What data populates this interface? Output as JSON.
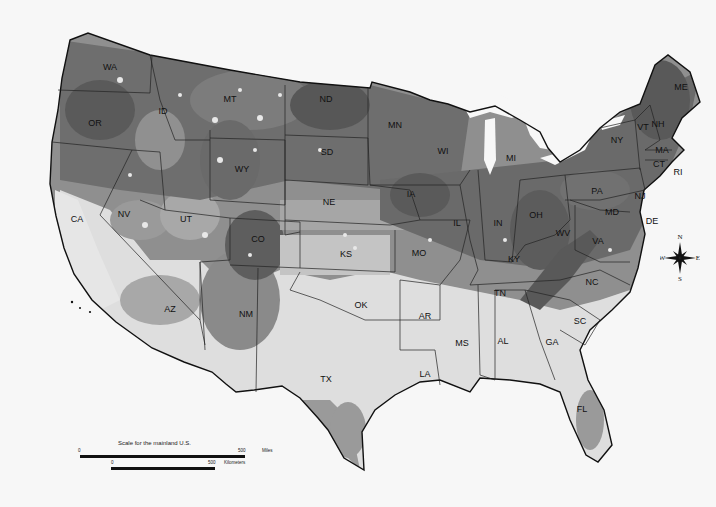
{
  "map": {
    "subject": "Contiguous United States shaded grayscale map",
    "palette": {
      "darkest": "#4a4a4a",
      "dark": "#6b6b6b",
      "medium": "#8f8f8f",
      "light": "#bdbdbd",
      "lightest": "#dedede",
      "water": "#f7f7f7",
      "border": "#111111"
    },
    "state_labels": [
      {
        "abbr": "WA",
        "x": 110,
        "y": 68
      },
      {
        "abbr": "OR",
        "x": 95,
        "y": 124
      },
      {
        "abbr": "CA",
        "x": 77,
        "y": 220
      },
      {
        "abbr": "NV",
        "x": 124,
        "y": 215
      },
      {
        "abbr": "ID",
        "x": 163,
        "y": 112
      },
      {
        "abbr": "MT",
        "x": 230,
        "y": 100
      },
      {
        "abbr": "WY",
        "x": 242,
        "y": 170
      },
      {
        "abbr": "UT",
        "x": 186,
        "y": 220
      },
      {
        "abbr": "CO",
        "x": 258,
        "y": 240
      },
      {
        "abbr": "AZ",
        "x": 170,
        "y": 310
      },
      {
        "abbr": "NM",
        "x": 246,
        "y": 315
      },
      {
        "abbr": "ND",
        "x": 326,
        "y": 100
      },
      {
        "abbr": "SD",
        "x": 327,
        "y": 153
      },
      {
        "abbr": "NE",
        "x": 329,
        "y": 203
      },
      {
        "abbr": "KS",
        "x": 346,
        "y": 255
      },
      {
        "abbr": "OK",
        "x": 361,
        "y": 306
      },
      {
        "abbr": "TX",
        "x": 326,
        "y": 380
      },
      {
        "abbr": "MN",
        "x": 395,
        "y": 126
      },
      {
        "abbr": "IA",
        "x": 411,
        "y": 195
      },
      {
        "abbr": "MO",
        "x": 419,
        "y": 254
      },
      {
        "abbr": "AR",
        "x": 425,
        "y": 317
      },
      {
        "abbr": "LA",
        "x": 425,
        "y": 375
      },
      {
        "abbr": "WI",
        "x": 443,
        "y": 152
      },
      {
        "abbr": "IL",
        "x": 457,
        "y": 224
      },
      {
        "abbr": "MS",
        "x": 462,
        "y": 344
      },
      {
        "abbr": "MI",
        "x": 511,
        "y": 159
      },
      {
        "abbr": "IN",
        "x": 498,
        "y": 224
      },
      {
        "abbr": "KY",
        "x": 514,
        "y": 260
      },
      {
        "abbr": "TN",
        "x": 500,
        "y": 294
      },
      {
        "abbr": "AL",
        "x": 503,
        "y": 342
      },
      {
        "abbr": "GA",
        "x": 552,
        "y": 343
      },
      {
        "abbr": "FL",
        "x": 582,
        "y": 410
      },
      {
        "abbr": "OH",
        "x": 536,
        "y": 216
      },
      {
        "abbr": "WV",
        "x": 563,
        "y": 234
      },
      {
        "abbr": "VA",
        "x": 598,
        "y": 242
      },
      {
        "abbr": "NC",
        "x": 592,
        "y": 283
      },
      {
        "abbr": "SC",
        "x": 580,
        "y": 322
      },
      {
        "abbr": "PA",
        "x": 597,
        "y": 192
      },
      {
        "abbr": "NY",
        "x": 617,
        "y": 141
      },
      {
        "abbr": "NJ",
        "x": 640,
        "y": 197
      },
      {
        "abbr": "MD",
        "x": 612,
        "y": 213
      },
      {
        "abbr": "DE",
        "x": 652,
        "y": 222
      },
      {
        "abbr": "VT",
        "x": 643,
        "y": 128
      },
      {
        "abbr": "NH",
        "x": 658,
        "y": 125
      },
      {
        "abbr": "MA",
        "x": 662,
        "y": 151
      },
      {
        "abbr": "CT",
        "x": 659,
        "y": 165
      },
      {
        "abbr": "RI",
        "x": 678,
        "y": 173
      },
      {
        "abbr": "ME",
        "x": 681,
        "y": 88
      }
    ]
  },
  "scale": {
    "title": "Scale for the mainland U.S.",
    "miles": {
      "start": "0",
      "end": "500",
      "unit": "Miles"
    },
    "kilometers": {
      "start": "0",
      "end": "500",
      "unit": "Kilometers"
    }
  },
  "compass": {
    "n": "N",
    "s": "S",
    "e": "E",
    "w": "W"
  }
}
